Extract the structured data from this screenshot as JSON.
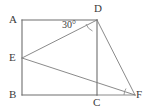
{
  "figure": {
    "background_color": "#ffffff",
    "line_color": "#6e6e6e",
    "text_color": "#3b3b3b",
    "width": 149,
    "height": 112
  },
  "vertices": [
    {
      "id": "A",
      "label": "A",
      "x": 22,
      "y": 20,
      "label_x": 9,
      "label_y": 14
    },
    {
      "id": "D",
      "label": "D",
      "x": 97,
      "y": 20,
      "label_x": 94,
      "label_y": 3
    },
    {
      "id": "E",
      "label": "E",
      "x": 22,
      "y": 58,
      "label_x": 9,
      "label_y": 52
    },
    {
      "id": "B",
      "label": "B",
      "x": 22,
      "y": 95,
      "label_x": 9,
      "label_y": 89
    },
    {
      "id": "C",
      "label": "C",
      "x": 97,
      "y": 95,
      "label_x": 93,
      "label_y": 97
    },
    {
      "id": "F",
      "label": "F",
      "x": 135,
      "y": 95,
      "label_x": 136,
      "label_y": 89
    }
  ],
  "segments": [
    {
      "id": "AD",
      "from": "A",
      "to": "D",
      "style": "solid"
    },
    {
      "id": "AB",
      "from": "A",
      "to": "B",
      "style": "solid"
    },
    {
      "id": "BC",
      "from": "B",
      "to": "C",
      "style": "solid"
    },
    {
      "id": "DC",
      "from": "D",
      "to": "C",
      "style": "solid"
    },
    {
      "id": "ED",
      "from": "E",
      "to": "D",
      "style": "solid"
    },
    {
      "id": "DF",
      "from": "D",
      "to": "F",
      "style": "solid"
    },
    {
      "id": "EF",
      "from": "E",
      "to": "F",
      "style": "solid"
    },
    {
      "id": "CF",
      "from": "C",
      "to": "F",
      "style": "solid"
    }
  ],
  "angles": [
    {
      "id": "angle-at-D",
      "label": "30°",
      "at_vertex": "D",
      "label_x": 62,
      "label_y": 20,
      "arc_path": "M 88 25 A 11 11 0 0 0 93.5 30.5"
    },
    {
      "id": "angle-tick-at-F",
      "label": "",
      "at_vertex": "F",
      "label_x": 0,
      "label_y": 0,
      "arc_path": "M 124.5 90.5 A 12 12 0 0 0 123 95"
    }
  ]
}
